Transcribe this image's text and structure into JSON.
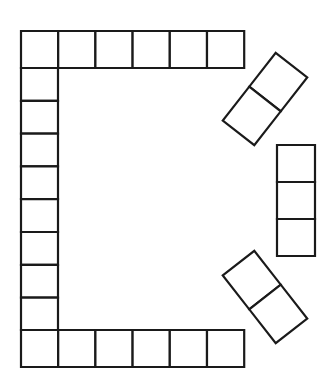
{
  "board": {
    "title": "Board Game Track Outline",
    "shape_name": "horseshoe-track",
    "description": "Blank board game path of rectangular spaces forming an open D shape",
    "canvas": {
      "width": 334,
      "height": 383
    },
    "colors": {
      "background": "#ffffff",
      "cell_fill": "#ffffff",
      "stroke": "#1a1a1a"
    },
    "stroke_width": 2.2,
    "total_spaces": 25,
    "segments": [
      {
        "name": "top-row",
        "orientation": "horizontal",
        "count": 6,
        "cell_width": 37.2,
        "cell_height": 37,
        "origin_x": 21,
        "origin_y": 31,
        "rotation": 0
      },
      {
        "name": "left-column",
        "orientation": "vertical",
        "count": 8,
        "cell_width": 37,
        "cell_height": 32.8,
        "origin_x": 21,
        "origin_y": 68,
        "rotation": 0
      },
      {
        "name": "bottom-row",
        "orientation": "horizontal",
        "count": 6,
        "cell_width": 37.2,
        "cell_height": 37,
        "origin_x": 21,
        "origin_y": 330,
        "rotation": 0
      },
      {
        "name": "right-column",
        "orientation": "vertical",
        "count": 3,
        "cell_width": 38,
        "cell_height": 37,
        "origin_x": 277,
        "origin_y": 145,
        "rotation": 0
      },
      {
        "name": "upper-right-diagonal",
        "orientation": "diagonal",
        "count": 2,
        "cell_width": 40,
        "cell_height": 43,
        "origin_x": 245,
        "origin_y": 58,
        "rotation": 38
      },
      {
        "name": "lower-right-diagonal",
        "orientation": "diagonal",
        "count": 2,
        "cell_width": 40,
        "cell_height": 43,
        "origin_x": 243,
        "origin_y": 297,
        "rotation": -38
      }
    ],
    "cells": {
      "top_row": [
        "",
        "",
        "",
        "",
        "",
        ""
      ],
      "left_column": [
        "",
        "",
        "",
        "",
        "",
        "",
        "",
        ""
      ],
      "bottom_row": [
        "",
        "",
        "",
        "",
        "",
        ""
      ],
      "right_column": [
        "",
        "",
        ""
      ],
      "upper_right_diagonal": [
        "",
        ""
      ],
      "lower_right_diagonal": [
        "",
        ""
      ]
    }
  }
}
